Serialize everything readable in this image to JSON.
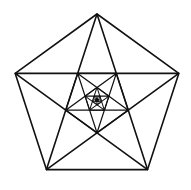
{
  "diagram": {
    "canvas": {
      "width": 191,
      "height": 190,
      "background": "#ffffff"
    },
    "center": {
      "x": 97,
      "y": 100
    },
    "outer_radius": 86,
    "stroke_color": "#111111",
    "stroke_width": 1.6,
    "scale_ratio": 0.381966,
    "levels": 7,
    "core_fill": "#111111",
    "shapes": [
      {
        "level": 0,
        "type": "pentagon-with-pentagram",
        "orientation": "point-up"
      },
      {
        "level": 1,
        "type": "pentagon-with-pentagram",
        "orientation": "point-down"
      },
      {
        "level": 2,
        "type": "pentagon-with-pentagram",
        "orientation": "point-up"
      },
      {
        "level": 3,
        "type": "pentagon-with-pentagram",
        "orientation": "point-down"
      },
      {
        "level": 4,
        "type": "pentagon-with-pentagram",
        "orientation": "point-up"
      },
      {
        "level": 5,
        "type": "pentagon-with-pentagram",
        "orientation": "point-down"
      },
      {
        "level": 6,
        "type": "pentagon-with-pentagram",
        "orientation": "point-up"
      }
    ]
  }
}
